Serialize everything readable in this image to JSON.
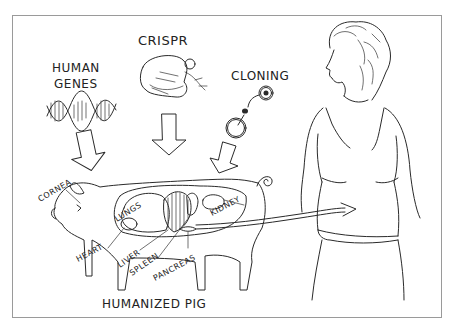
{
  "diagram": {
    "title": "Humanized Pig",
    "sources": [
      {
        "id": "human-genes",
        "label_line1": "HUMAN",
        "label_line2": "GENES",
        "icon": "dna-helix-icon"
      },
      {
        "id": "crispr",
        "label": "CRISPR",
        "icon": "crispr-enzyme-icon"
      },
      {
        "id": "cloning",
        "label": "CLONING",
        "icon": "cell-nucleus-transfer-icon"
      }
    ],
    "pig_label": "HUMANIZED PIG",
    "organs": [
      {
        "label": "CORNEA"
      },
      {
        "label": "LUNGS"
      },
      {
        "label": "HEART"
      },
      {
        "label": "LIVER"
      },
      {
        "label": "SPLEEN"
      },
      {
        "label": "PANCREAS"
      },
      {
        "label": "KIDNEY"
      }
    ],
    "recipient": "human-figure",
    "colors": {
      "ink": "#2a2a2a",
      "frame": "#9a9a9a",
      "background": "#ffffff"
    }
  }
}
